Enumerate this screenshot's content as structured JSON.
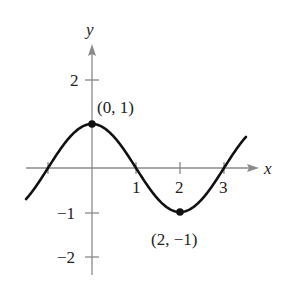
{
  "chart_data": {
    "type": "line",
    "title": "",
    "function": "y = cos(pi x / 2)",
    "xlabel": "x",
    "ylabel": "y",
    "xlim": [
      -1.6,
      3.6
    ],
    "ylim": [
      -2.5,
      2.7
    ],
    "x_ticks": [
      -1,
      1,
      2,
      3
    ],
    "x_tick_labels": [
      "",
      "1",
      "2",
      "3"
    ],
    "y_ticks": [
      2,
      -1,
      -2
    ],
    "y_tick_labels": [
      "2",
      "−1",
      "−2"
    ],
    "grid": false,
    "series": [
      {
        "name": "curve",
        "x": [
          -1.5,
          -1,
          0,
          1,
          2,
          3,
          3.5
        ],
        "y": [
          -0.707,
          0,
          1,
          0,
          -1,
          0,
          0.707
        ]
      }
    ],
    "annotations": [
      {
        "point": [
          0,
          1
        ],
        "label": "(0, 1)"
      },
      {
        "point": [
          2,
          -1
        ],
        "label": "(2, −1)"
      }
    ]
  },
  "labels": {
    "x_axis": "x",
    "y_axis": "y",
    "tick_x1": "1",
    "tick_x2": "2",
    "tick_x3": "3",
    "tick_y2": "2",
    "tick_ym1": "−1",
    "tick_ym2": "−2",
    "point_max": "(0, 1)",
    "point_min": "(2, −1)"
  },
  "colors": {
    "axis": "#888888",
    "curve": "#111111"
  }
}
